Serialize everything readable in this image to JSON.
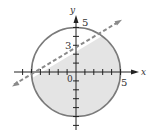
{
  "diagram": {
    "type": "coordinate-graph",
    "axes": {
      "x_label": "x",
      "y_label": "y",
      "origin_label": "0",
      "x_range": [
        -6,
        6
      ],
      "y_range": [
        -6,
        6
      ]
    },
    "labels": {
      "y_intercept_circle": "5",
      "x_intercept_circle": "5",
      "line_y_intercept": "3",
      "origin": "0",
      "x_axis": "x",
      "y_axis": "y"
    },
    "circle": {
      "center": [
        0,
        0
      ],
      "radius": 5,
      "stroke": "#7a7a7a",
      "fill": "#e4e4e4"
    },
    "boundary_line": {
      "equation": "y = 3/5 x + 3",
      "slope": 0.6,
      "intercept": 3,
      "style": "dashed",
      "color": "#8a8a8a"
    },
    "shaded_region": "x^2 + y^2 <= 25 and y < 3/5 x + 3",
    "colors": {
      "axis": "#222222",
      "shade": "#e4e4e4",
      "circle": "#7a7a7a",
      "dashed_line": "#8a8a8a"
    }
  }
}
